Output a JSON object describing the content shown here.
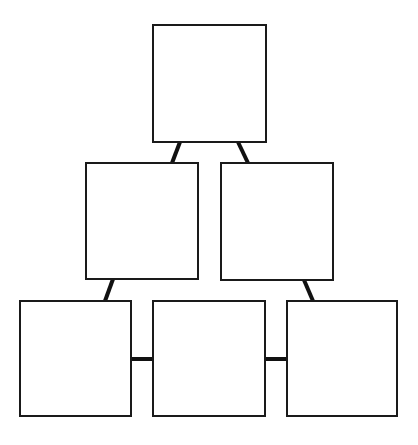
{
  "diagram": {
    "type": "pyramid-hierarchy",
    "background": "#ffffff",
    "stroke_color": "#1a1a1a",
    "edge_color": "#111111",
    "nodes": [
      {
        "id": "top",
        "label": "",
        "x": 153,
        "y": 25,
        "w": 113,
        "h": 117
      },
      {
        "id": "mid-left",
        "label": "",
        "x": 86,
        "y": 163,
        "w": 112,
        "h": 116
      },
      {
        "id": "mid-right",
        "label": "",
        "x": 221,
        "y": 163,
        "w": 112,
        "h": 117
      },
      {
        "id": "bottom-left",
        "label": "",
        "x": 20,
        "y": 301,
        "w": 111,
        "h": 115
      },
      {
        "id": "bottom-middle",
        "label": "",
        "x": 153,
        "y": 301,
        "w": 112,
        "h": 115
      },
      {
        "id": "bottom-right",
        "label": "",
        "x": 287,
        "y": 301,
        "w": 110,
        "h": 115
      }
    ],
    "edges": [
      {
        "from": "top",
        "to": "mid-left",
        "x1": 180,
        "y1": 142,
        "x2": 172,
        "y2": 163
      },
      {
        "from": "top",
        "to": "mid-right",
        "x1": 238,
        "y1": 142,
        "x2": 248,
        "y2": 163
      },
      {
        "from": "mid-left",
        "to": "bottom-left",
        "x1": 113,
        "y1": 279,
        "x2": 105,
        "y2": 301
      },
      {
        "from": "mid-right",
        "to": "bottom-right",
        "x1": 304,
        "y1": 280,
        "x2": 313,
        "y2": 301
      },
      {
        "from": "bottom-left",
        "to": "bottom-middle",
        "x1": 131,
        "y1": 359,
        "x2": 153,
        "y2": 359
      },
      {
        "from": "bottom-middle",
        "to": "bottom-right",
        "x1": 265,
        "y1": 359,
        "x2": 287,
        "y2": 359
      }
    ]
  }
}
